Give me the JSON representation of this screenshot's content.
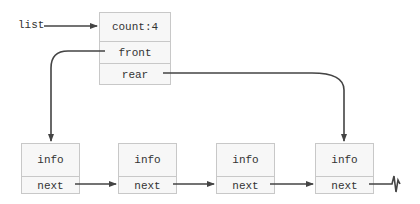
{
  "diagram": {
    "type": "linked-queue",
    "pointer_label": "list",
    "header": {
      "fields": [
        "count:4",
        "front",
        "rear"
      ]
    },
    "nodes": [
      {
        "fields": [
          "info",
          "next"
        ]
      },
      {
        "fields": [
          "info",
          "next"
        ]
      },
      {
        "fields": [
          "info",
          "next"
        ]
      },
      {
        "fields": [
          "info",
          "next"
        ]
      }
    ],
    "terminator": "null-ground-symbol",
    "colors": {
      "line": "#444444",
      "box_fill": "#f7f7f7",
      "box_border": "#c8c8c8",
      "text": "#333333"
    }
  }
}
